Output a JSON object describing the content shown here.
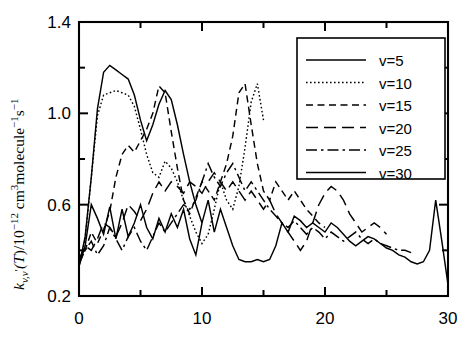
{
  "chart_data": {
    "type": "line",
    "title": "",
    "xlabel": "",
    "ylabel": "k_{v,v'}(T)/10^{-12} cm^3 molecule^-1 s^-1",
    "xlim": [
      0,
      30
    ],
    "ylim": [
      0.2,
      1.4
    ],
    "grid": false,
    "legend_position": "top-right",
    "x_ticks_major": [
      "0",
      "10",
      "20",
      "30"
    ],
    "x_ticks_major_values": [
      0,
      10,
      20,
      30
    ],
    "x_ticks_minor_values": [
      5,
      15,
      25
    ],
    "y_ticks_major": [
      "0.2",
      "0.6",
      "1.0",
      "1.4"
    ],
    "y_ticks_major_values": [
      0.2,
      0.6,
      1.0,
      1.4
    ],
    "y_ticks_minor_values": [
      0.4,
      0.8,
      1.2
    ],
    "series": [
      {
        "name": "v=5",
        "style": "solid",
        "x": [
          0,
          0.5,
          1,
          1.5,
          2,
          2.5,
          3,
          3.5,
          4,
          4.5,
          5,
          5.5,
          6,
          6.5,
          7,
          7.5,
          8,
          8.5,
          9,
          9.5,
          10
        ],
        "values": [
          0.33,
          0.46,
          0.72,
          1.02,
          1.18,
          1.21,
          1.19,
          1.17,
          1.15,
          1.08,
          0.97,
          0.88,
          0.95,
          1.04,
          1.1,
          1.06,
          0.95,
          0.82,
          0.7,
          0.6,
          0.52
        ]
      },
      {
        "name": "v=10",
        "style": "dotted",
        "x": [
          0,
          0.5,
          1,
          1.5,
          2,
          2.5,
          3,
          3.5,
          4,
          4.5,
          5,
          5.5,
          6,
          6.5,
          7,
          7.5,
          8,
          8.5,
          9,
          9.5,
          10,
          10.5,
          11,
          11.5,
          12,
          12.5,
          13,
          13.5,
          14,
          14.5,
          15
        ],
        "values": [
          0.33,
          0.45,
          0.72,
          0.99,
          1.08,
          1.09,
          1.1,
          1.09,
          1.08,
          1.03,
          0.93,
          0.82,
          0.74,
          0.72,
          0.79,
          0.76,
          0.7,
          0.62,
          0.55,
          0.48,
          0.43,
          0.47,
          0.58,
          0.7,
          0.62,
          0.58,
          0.68,
          0.85,
          1.05,
          1.13,
          0.97
        ]
      },
      {
        "name": "v=15",
        "style": "dashed",
        "x": [
          0,
          0.5,
          1,
          1.5,
          2,
          2.5,
          3,
          3.5,
          4,
          4.5,
          5,
          5.5,
          6,
          6.5,
          7,
          7.5,
          8,
          8.5,
          9,
          9.5,
          10,
          10.5,
          11,
          11.5,
          12,
          12.5,
          13,
          13.5,
          14,
          14.5,
          15,
          15.5,
          16,
          16.5,
          17,
          17.5,
          18,
          18.5,
          19,
          19.5,
          20
        ],
        "values": [
          0.35,
          0.4,
          0.48,
          0.43,
          0.49,
          0.57,
          0.72,
          0.82,
          0.86,
          0.83,
          0.88,
          0.93,
          1.0,
          1.12,
          1.09,
          0.92,
          0.76,
          0.62,
          0.56,
          0.63,
          0.7,
          0.66,
          0.62,
          0.7,
          0.78,
          0.9,
          1.09,
          1.13,
          0.95,
          0.78,
          0.66,
          0.62,
          0.7,
          0.66,
          0.62,
          0.66,
          0.62,
          0.58,
          0.55,
          0.52,
          0.5
        ]
      },
      {
        "name": "v=20",
        "style": "longdash",
        "x": [
          0,
          0.5,
          1,
          1.5,
          2,
          2.5,
          3,
          3.5,
          4,
          4.5,
          5,
          5.5,
          6,
          6.5,
          7,
          7.5,
          8,
          8.5,
          9,
          9.5,
          10,
          10.5,
          11,
          11.5,
          12,
          12.5,
          13,
          13.5,
          14,
          14.5,
          15,
          15.5,
          16,
          16.5,
          17,
          17.5,
          18,
          18.5,
          19,
          19.5,
          20,
          20.5,
          21,
          21.5,
          22,
          22.5,
          23,
          23.5,
          24,
          24.5,
          25
        ],
        "values": [
          0.36,
          0.42,
          0.4,
          0.45,
          0.52,
          0.5,
          0.46,
          0.52,
          0.6,
          0.57,
          0.53,
          0.58,
          0.65,
          0.7,
          0.66,
          0.7,
          0.68,
          0.65,
          0.7,
          0.68,
          0.65,
          0.7,
          0.74,
          0.7,
          0.66,
          0.7,
          0.66,
          0.62,
          0.66,
          0.62,
          0.58,
          0.62,
          0.56,
          0.52,
          0.48,
          0.44,
          0.4,
          0.44,
          0.52,
          0.6,
          0.65,
          0.68,
          0.66,
          0.62,
          0.56,
          0.52,
          0.48,
          0.5,
          0.52,
          0.5,
          0.47
        ]
      },
      {
        "name": "v=25",
        "style": "dashdot",
        "x": [
          0,
          0.5,
          1,
          1.5,
          2,
          2.5,
          3,
          3.5,
          4,
          4.5,
          5,
          5.5,
          6,
          6.5,
          7,
          7.5,
          8,
          8.5,
          9,
          9.5,
          10,
          10.5,
          11,
          11.5,
          12,
          12.5,
          13,
          13.5,
          14,
          14.5,
          15,
          15.5,
          16,
          16.5,
          17,
          17.5,
          18,
          18.5,
          19,
          19.5,
          20,
          20.5,
          21,
          21.5,
          22,
          22.5,
          23,
          23.5,
          24,
          24.5,
          25,
          25.5,
          26,
          26.5,
          27
        ],
        "values": [
          0.34,
          0.4,
          0.44,
          0.38,
          0.42,
          0.5,
          0.45,
          0.4,
          0.46,
          0.5,
          0.44,
          0.4,
          0.46,
          0.52,
          0.48,
          0.52,
          0.56,
          0.6,
          0.58,
          0.62,
          0.7,
          0.78,
          0.72,
          0.68,
          0.74,
          0.78,
          0.72,
          0.66,
          0.7,
          0.66,
          0.62,
          0.58,
          0.55,
          0.52,
          0.5,
          0.53,
          0.5,
          0.47,
          0.5,
          0.48,
          0.45,
          0.48,
          0.46,
          0.44,
          0.46,
          0.48,
          0.45,
          0.43,
          0.45,
          0.43,
          0.42,
          0.41,
          0.4,
          0.4,
          0.39
        ]
      },
      {
        "name": "v=30",
        "style": "solid",
        "x": [
          0,
          0.5,
          1,
          1.5,
          2,
          2.5,
          3,
          3.5,
          4,
          4.5,
          5,
          5.5,
          6,
          6.5,
          7,
          7.5,
          8,
          8.5,
          9,
          9.5,
          10,
          10.5,
          11,
          11.5,
          12,
          12.5,
          13,
          13.5,
          14,
          14.5,
          15,
          15.5,
          16,
          16.5,
          17,
          17.5,
          18,
          18.5,
          19,
          19.5,
          20,
          20.5,
          21,
          21.5,
          22,
          22.5,
          23,
          23.5,
          24,
          24.5,
          25,
          25.5,
          26,
          26.5,
          27,
          27.5,
          28,
          28.5,
          29,
          29.5,
          30
        ],
        "values": [
          0.33,
          0.42,
          0.6,
          0.54,
          0.47,
          0.59,
          0.45,
          0.58,
          0.46,
          0.52,
          0.6,
          0.5,
          0.45,
          0.54,
          0.48,
          0.56,
          0.5,
          0.58,
          0.45,
          0.38,
          0.52,
          0.62,
          0.48,
          0.58,
          0.5,
          0.42,
          0.36,
          0.35,
          0.35,
          0.36,
          0.35,
          0.36,
          0.42,
          0.52,
          0.48,
          0.55,
          0.53,
          0.5,
          0.52,
          0.5,
          0.48,
          0.52,
          0.5,
          0.47,
          0.44,
          0.42,
          0.44,
          0.46,
          0.45,
          0.43,
          0.41,
          0.4,
          0.38,
          0.37,
          0.35,
          0.34,
          0.35,
          0.4,
          0.62,
          0.44,
          0.25
        ]
      }
    ]
  },
  "axis": {
    "y_label_parts": {
      "k": "k",
      "sub1": "v,v",
      "prime": "′",
      "paren_T": "(T)",
      "slash10": "/10",
      "exp12": "−12",
      "units_cm": " cm",
      "exp3": "3",
      "molecule": "molecule",
      "exp_m1": "−1",
      "s": "s",
      "exp_s1": "−1"
    }
  },
  "legend": {
    "entries": [
      {
        "label": "v=5",
        "style": "solid"
      },
      {
        "label": "v=10",
        "style": "dotted"
      },
      {
        "label": "v=15",
        "style": "dashed"
      },
      {
        "label": "v=20",
        "style": "longdash"
      },
      {
        "label": "v=25",
        "style": "dashdot"
      },
      {
        "label": "v=30",
        "style": "solid"
      }
    ]
  },
  "colors": {
    "ink": "#000000",
    "background": "#ffffff"
  }
}
